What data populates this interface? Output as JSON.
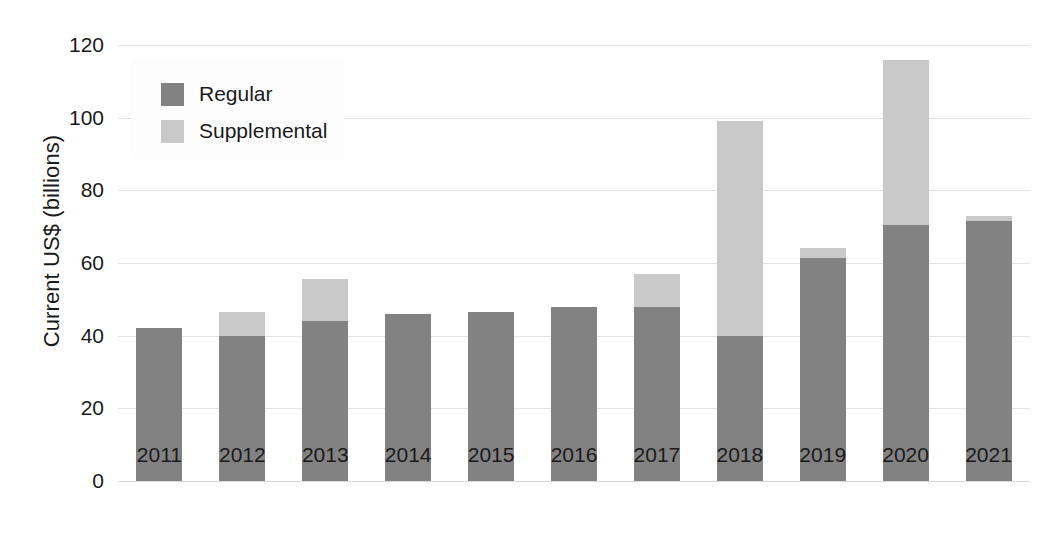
{
  "chart_data": {
    "type": "bar",
    "stacked": true,
    "title": "",
    "xlabel": "",
    "ylabel": "Current US$ (billions)",
    "categories": [
      "2011",
      "2012",
      "2013",
      "2014",
      "2015",
      "2016",
      "2017",
      "2018",
      "2019",
      "2020",
      "2021"
    ],
    "series": [
      {
        "name": "Regular",
        "color": "#828282",
        "values": [
          42,
          40,
          44,
          46,
          46.5,
          48,
          48,
          40,
          61.5,
          70.5,
          71.5
        ]
      },
      {
        "name": "Supplemental",
        "color": "#c9c9c9",
        "values": [
          0,
          6.5,
          11.5,
          0,
          0,
          0,
          9,
          59,
          2.5,
          45.5,
          1.5
        ]
      }
    ],
    "totals": [
      42,
      46.5,
      55.5,
      46,
      46.5,
      48,
      57,
      99,
      64,
      116,
      73
    ],
    "ylim": [
      0,
      120
    ],
    "yticks": [
      0,
      20,
      40,
      60,
      80,
      100,
      120
    ],
    "ytick_labels": [
      "0",
      "20",
      "40",
      "60",
      "80",
      "100",
      "120"
    ],
    "grid": true,
    "legend_position": "upper left",
    "legend_entries": [
      "Regular",
      "Supplemental"
    ]
  },
  "axes": {
    "y_title": "Current US$ (billions)"
  },
  "legend": {
    "items": [
      {
        "label": "Regular",
        "color": "#828282"
      },
      {
        "label": "Supplemental",
        "color": "#c9c9c9"
      }
    ]
  }
}
